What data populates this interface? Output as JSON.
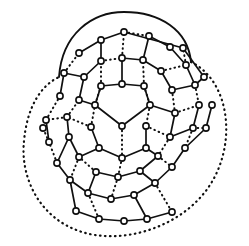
{
  "figure": {
    "kind": "graph-diagram",
    "caption": "",
    "background_color": "#ffffff",
    "ink_color": "#101010",
    "canvas": {
      "width": 249,
      "height": 246
    }
  },
  "style": {
    "vertex_radius": 3.1,
    "vertex_fill": "#ffffff",
    "vertex_stroke": "#101010",
    "vertex_stroke_width": 1.6,
    "solid_edge_width": 1.7,
    "dotted_edge_width": 2.0,
    "dotted_pattern": "0.6 4.0"
  },
  "chart_data": {
    "type": "scatter",
    "xlabel": "",
    "ylabel": "",
    "grid": false,
    "legend": "none",
    "xlim": [
      0,
      249
    ],
    "ylim": [
      246,
      0
    ],
    "vertices": [
      {
        "id": "c0",
        "ring": "center",
        "x": 122,
        "y": 126
      },
      {
        "id": "r1a",
        "ring": "inner",
        "x": 95,
        "y": 105
      },
      {
        "id": "r1b",
        "ring": "inner",
        "x": 101,
        "y": 86
      },
      {
        "id": "r1c",
        "ring": "inner",
        "x": 122,
        "y": 84
      },
      {
        "id": "r1d",
        "ring": "inner",
        "x": 144,
        "y": 86
      },
      {
        "id": "r1e",
        "ring": "inner",
        "x": 150,
        "y": 105
      },
      {
        "id": "r1f",
        "ring": "inner",
        "x": 146,
        "y": 126
      },
      {
        "id": "r1g",
        "ring": "inner",
        "x": 146,
        "y": 148
      },
      {
        "id": "r1h",
        "ring": "inner",
        "x": 122,
        "y": 158
      },
      {
        "id": "r1i",
        "ring": "inner",
        "x": 99,
        "y": 148
      },
      {
        "id": "r1j",
        "ring": "inner",
        "x": 91,
        "y": 127
      },
      {
        "id": "r2a",
        "ring": "middle",
        "x": 79,
        "y": 100
      },
      {
        "id": "r2b",
        "ring": "middle",
        "x": 84,
        "y": 77
      },
      {
        "id": "r2c",
        "ring": "middle",
        "x": 101,
        "y": 61
      },
      {
        "id": "r2d",
        "ring": "middle",
        "x": 122,
        "y": 58
      },
      {
        "id": "r2e",
        "ring": "middle",
        "x": 143,
        "y": 60
      },
      {
        "id": "r2f",
        "ring": "middle",
        "x": 161,
        "y": 71
      },
      {
        "id": "r2g",
        "ring": "middle",
        "x": 172,
        "y": 90
      },
      {
        "id": "r2h",
        "ring": "middle",
        "x": 175,
        "y": 113
      },
      {
        "id": "r2i",
        "ring": "middle",
        "x": 170,
        "y": 137
      },
      {
        "id": "r2j",
        "ring": "middle",
        "x": 158,
        "y": 156
      },
      {
        "id": "r2k",
        "ring": "middle",
        "x": 140,
        "y": 171
      },
      {
        "id": "r2l",
        "ring": "middle",
        "x": 118,
        "y": 177
      },
      {
        "id": "r2m",
        "ring": "middle",
        "x": 96,
        "y": 172
      },
      {
        "id": "r2n",
        "ring": "middle",
        "x": 79,
        "y": 157
      },
      {
        "id": "r2o",
        "ring": "middle",
        "x": 69,
        "y": 137
      },
      {
        "id": "r2p",
        "ring": "middle",
        "x": 67,
        "y": 117
      },
      {
        "id": "r3a",
        "ring": "outer",
        "x": 60,
        "y": 96
      },
      {
        "id": "r3b",
        "ring": "outer",
        "x": 64,
        "y": 73
      },
      {
        "id": "r3c",
        "ring": "outer",
        "x": 79,
        "y": 53
      },
      {
        "id": "r3d",
        "ring": "outer",
        "x": 101,
        "y": 40
      },
      {
        "id": "r3e",
        "ring": "outer",
        "x": 124,
        "y": 32
      },
      {
        "id": "r3f",
        "ring": "outer",
        "x": 149,
        "y": 36
      },
      {
        "id": "r3g",
        "ring": "outer",
        "x": 170,
        "y": 47
      },
      {
        "id": "r3h",
        "ring": "outer",
        "x": 186,
        "y": 65
      },
      {
        "id": "r3i",
        "ring": "outer",
        "x": 195,
        "y": 85
      },
      {
        "id": "r3j",
        "ring": "outer",
        "x": 199,
        "y": 105
      },
      {
        "id": "r3k",
        "ring": "outer",
        "x": 193,
        "y": 128
      },
      {
        "id": "r3l",
        "ring": "outer",
        "x": 185,
        "y": 148
      },
      {
        "id": "r3m",
        "ring": "outer",
        "x": 172,
        "y": 167
      },
      {
        "id": "r3n",
        "ring": "outer",
        "x": 155,
        "y": 183
      },
      {
        "id": "r3o",
        "ring": "outer",
        "x": 134,
        "y": 195
      },
      {
        "id": "r3p",
        "ring": "outer",
        "x": 111,
        "y": 199
      },
      {
        "id": "r3q",
        "ring": "outer",
        "x": 88,
        "y": 193
      },
      {
        "id": "r3r",
        "ring": "outer",
        "x": 70,
        "y": 180
      },
      {
        "id": "r3s",
        "ring": "outer",
        "x": 57,
        "y": 163
      },
      {
        "id": "r3t",
        "ring": "outer",
        "x": 49,
        "y": 142
      },
      {
        "id": "r3u",
        "ring": "outer",
        "x": 46,
        "y": 120
      },
      {
        "id": "r4a",
        "ring": "rim",
        "x": 76,
        "y": 211
      },
      {
        "id": "r4b",
        "ring": "rim",
        "x": 99,
        "y": 219
      },
      {
        "id": "r4c",
        "ring": "rim",
        "x": 124,
        "y": 221
      },
      {
        "id": "r4d",
        "ring": "rim",
        "x": 147,
        "y": 219
      },
      {
        "id": "r4e",
        "ring": "rim",
        "x": 172,
        "y": 212
      },
      {
        "id": "r4f",
        "ring": "rim",
        "x": 206,
        "y": 128
      },
      {
        "id": "r4g",
        "ring": "rim",
        "x": 212,
        "y": 105
      },
      {
        "id": "r4h",
        "ring": "rim",
        "x": 204,
        "y": 77
      },
      {
        "id": "r4i",
        "ring": "rim",
        "x": 183,
        "y": 48
      },
      {
        "id": "r4j",
        "ring": "rim",
        "x": 43,
        "y": 128
      }
    ],
    "edges_solid": [
      [
        "c0",
        "r1a"
      ],
      [
        "c0",
        "r1e"
      ],
      [
        "r1a",
        "r1b"
      ],
      [
        "r1b",
        "r1c"
      ],
      [
        "r1c",
        "r1d"
      ],
      [
        "r1d",
        "r1e"
      ],
      [
        "r1f",
        "r1g"
      ],
      [
        "r1g",
        "r1h"
      ],
      [
        "r1h",
        "r1i"
      ],
      [
        "r1i",
        "r1j"
      ],
      [
        "r1a",
        "r2a"
      ],
      [
        "r1c",
        "r2d"
      ],
      [
        "r1e",
        "r2h"
      ],
      [
        "r1g",
        "r2j"
      ],
      [
        "r1i",
        "r2n"
      ],
      [
        "r2a",
        "r2b"
      ],
      [
        "r2b",
        "r2c"
      ],
      [
        "r2d",
        "r2e"
      ],
      [
        "r2e",
        "r2f"
      ],
      [
        "r2f",
        "r2g"
      ],
      [
        "r2h",
        "r2i"
      ],
      [
        "r2j",
        "r2k"
      ],
      [
        "r2k",
        "r2l"
      ],
      [
        "r2l",
        "r2m"
      ],
      [
        "r2n",
        "r2o"
      ],
      [
        "r2o",
        "r2p"
      ],
      [
        "r2b",
        "r3b"
      ],
      [
        "r2c",
        "r3d"
      ],
      [
        "r2e",
        "r3f"
      ],
      [
        "r2g",
        "r3i"
      ],
      [
        "r2i",
        "r3k"
      ],
      [
        "r2k",
        "r3n"
      ],
      [
        "r2m",
        "r3q"
      ],
      [
        "r2o",
        "r3s"
      ],
      [
        "r3a",
        "r3b"
      ],
      [
        "r3c",
        "r3d"
      ],
      [
        "r3d",
        "r3e"
      ],
      [
        "r3f",
        "r3g"
      ],
      [
        "r3g",
        "r3h"
      ],
      [
        "r3h",
        "r3i"
      ],
      [
        "r3j",
        "r3k"
      ],
      [
        "r3l",
        "r3m"
      ],
      [
        "r3m",
        "r3n"
      ],
      [
        "r3n",
        "r3o"
      ],
      [
        "r3o",
        "r3p"
      ],
      [
        "r3p",
        "r3q"
      ],
      [
        "r3q",
        "r3r"
      ],
      [
        "r3r",
        "r3s"
      ],
      [
        "r3t",
        "r3u"
      ],
      [
        "r3r",
        "r4a"
      ],
      [
        "r3o",
        "r4d"
      ],
      [
        "r3l",
        "r4f"
      ],
      [
        "r3i",
        "r4h"
      ],
      [
        "r3e",
        "r4i"
      ],
      [
        "r4a",
        "r4b"
      ],
      [
        "r4b",
        "r4c"
      ],
      [
        "r4c",
        "r4d"
      ],
      [
        "r4d",
        "r4e"
      ],
      [
        "r4f",
        "r4g"
      ],
      [
        "r4h",
        "r4i"
      ]
    ],
    "edges_dotted": [
      [
        "c0",
        "r1h"
      ],
      [
        "r1b",
        "r1a"
      ],
      [
        "r1d",
        "r1e"
      ],
      [
        "r1e",
        "r1f"
      ],
      [
        "r1j",
        "r1a"
      ],
      [
        "r1b",
        "r2c"
      ],
      [
        "r1d",
        "r2e"
      ],
      [
        "r1f",
        "r2i"
      ],
      [
        "r1h",
        "r2l"
      ],
      [
        "r1j",
        "r2p"
      ],
      [
        "r2c",
        "r2d"
      ],
      [
        "r2g",
        "r2h"
      ],
      [
        "r2i",
        "r2j"
      ],
      [
        "r2m",
        "r2n"
      ],
      [
        "r2p",
        "r2a"
      ],
      [
        "r2d",
        "r3e"
      ],
      [
        "r2f",
        "r3h"
      ],
      [
        "r2h",
        "r3j"
      ],
      [
        "r2j",
        "r3m"
      ],
      [
        "r2l",
        "r3p"
      ],
      [
        "r2n",
        "r3r"
      ],
      [
        "r2p",
        "r3u"
      ],
      [
        "r3b",
        "r3c"
      ],
      [
        "r3e",
        "r3f"
      ],
      [
        "r3i",
        "r3j"
      ],
      [
        "r3k",
        "r3l"
      ],
      [
        "r3s",
        "r3t"
      ],
      [
        "r3u",
        "r3a"
      ],
      [
        "r3q",
        "r4b"
      ],
      [
        "r3n",
        "r4e"
      ],
      [
        "r3k",
        "r4f"
      ],
      [
        "r3h",
        "r4i"
      ],
      [
        "r3t",
        "r4j"
      ]
    ],
    "outer_arcs": [
      {
        "id": "top-arc",
        "style": "solid",
        "path": "M 59 77 C 62 34, 92 12, 124 12 C 160 12, 188 30, 191 62",
        "description": "solid outermost cap over the top of the figure"
      },
      {
        "id": "outer-dotted-arc",
        "style": "dotted",
        "path": "M 191 62 C 232 82, 238 150, 205 192 C 175 230, 120 244, 82 232 C 40 219, 20 178, 24 141 C 27 108, 40 86, 59 77",
        "description": "dotted outermost arc sweeping around the right, bottom and left"
      }
    ],
    "counts": {
      "vertices": 59,
      "rings": 4,
      "center_vertices": 1
    }
  }
}
